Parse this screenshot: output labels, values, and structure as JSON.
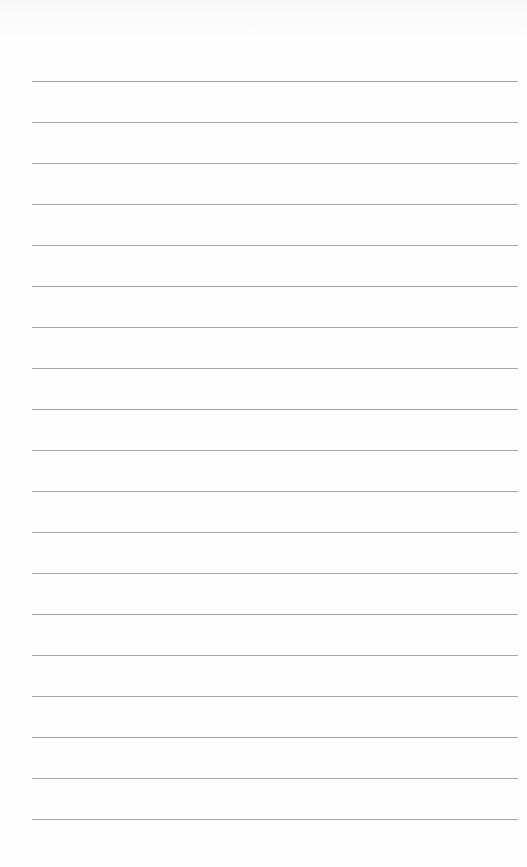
{
  "page": {
    "type": "lined-paper",
    "background_color": "#fefefe",
    "line_color": "#9c9c9c",
    "line_count": 19,
    "first_line_y": 81,
    "line_spacing": 41,
    "line_left": 32,
    "line_right": 518
  },
  "lines": [
    {
      "text": ""
    },
    {
      "text": ""
    },
    {
      "text": ""
    },
    {
      "text": ""
    },
    {
      "text": ""
    },
    {
      "text": ""
    },
    {
      "text": ""
    },
    {
      "text": ""
    },
    {
      "text": ""
    },
    {
      "text": ""
    },
    {
      "text": ""
    },
    {
      "text": ""
    },
    {
      "text": ""
    },
    {
      "text": ""
    },
    {
      "text": ""
    },
    {
      "text": ""
    },
    {
      "text": ""
    },
    {
      "text": ""
    },
    {
      "text": ""
    }
  ]
}
